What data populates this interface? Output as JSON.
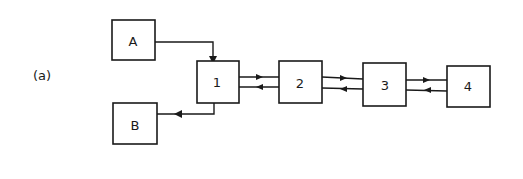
{
  "figure": {
    "panel_label": "(a)",
    "nodes": [
      {
        "id": "A",
        "label": "A"
      },
      {
        "id": "B",
        "label": "B"
      },
      {
        "id": "1",
        "label": "1"
      },
      {
        "id": "2",
        "label": "2"
      },
      {
        "id": "3",
        "label": "3"
      },
      {
        "id": "4",
        "label": "4"
      }
    ],
    "edges": [
      {
        "from": "A",
        "to": "1"
      },
      {
        "from": "1",
        "to": "B"
      },
      {
        "from": "1",
        "to": "2"
      },
      {
        "from": "2",
        "to": "1"
      },
      {
        "from": "2",
        "to": "3"
      },
      {
        "from": "3",
        "to": "2"
      },
      {
        "from": "3",
        "to": "4"
      },
      {
        "from": "4",
        "to": "3"
      }
    ],
    "colors": {
      "stroke": "#1a1a1a",
      "background": "#ffffff"
    }
  }
}
